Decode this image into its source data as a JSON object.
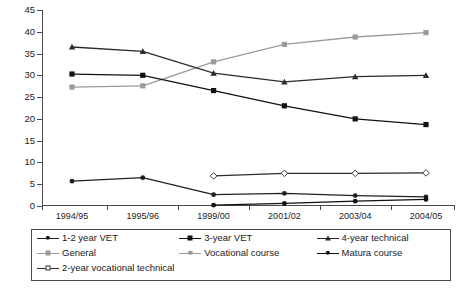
{
  "chart_data": {
    "type": "line",
    "title": "",
    "xlabel": "",
    "ylabel": "",
    "categories": [
      "1994/95",
      "1995/96",
      "1999/00",
      "2001/02",
      "2003/04",
      "2004/05"
    ],
    "ylim": [
      0,
      45
    ],
    "ytick_step": 5,
    "yticks": [
      0,
      5,
      10,
      15,
      20,
      25,
      30,
      35,
      40,
      45
    ],
    "grid": false,
    "legend_position": "bottom",
    "series": [
      {
        "name": "1-2 year VET",
        "marker": "dot",
        "color": "#1f1f1f",
        "values": [
          5.7,
          6.5,
          2.6,
          2.9,
          2.4,
          2.1
        ]
      },
      {
        "name": "3-year VET",
        "marker": "square",
        "color": "#111111",
        "values": [
          30.3,
          30.0,
          26.5,
          23.0,
          20.0,
          18.7
        ]
      },
      {
        "name": "4-year technical",
        "marker": "triangle",
        "color": "#2b2b2b",
        "values": [
          36.5,
          35.5,
          30.5,
          28.5,
          29.7,
          30.0
        ]
      },
      {
        "name": "General",
        "marker": "square",
        "color": "#9a9a9a",
        "values": [
          27.3,
          27.6,
          null,
          null,
          null,
          null
        ]
      },
      {
        "name": "Vocational course",
        "marker": "square",
        "color": "#9a9a9a",
        "values": [
          null,
          null,
          33.1,
          37.1,
          38.8,
          39.8
        ]
      },
      {
        "name": "Matura course",
        "marker": "dot",
        "color": "#111111",
        "values": [
          null,
          null,
          0.2,
          0.6,
          1.1,
          1.5
        ]
      },
      {
        "name": "2-year vocational technical",
        "marker": "diamond-open",
        "color": "#2b2b2b",
        "values": [
          null,
          null,
          6.9,
          7.5,
          7.5,
          7.6
        ]
      }
    ],
    "legend": [
      {
        "label": "1-2 year VET",
        "marker": "dot",
        "color": "#1f1f1f"
      },
      {
        "label": "3-year VET",
        "marker": "square",
        "color": "#111111"
      },
      {
        "label": "4-year technical",
        "marker": "triangle",
        "color": "#2b2b2b"
      },
      {
        "label": "General",
        "marker": "square",
        "color": "#9a9a9a"
      },
      {
        "label": "Vocational course",
        "marker": "dot",
        "color": "#9a9a9a"
      },
      {
        "label": "Matura course",
        "marker": "dot",
        "color": "#111111"
      },
      {
        "label": "2-year vocational technical",
        "marker": "diamond-open",
        "color": "#2b2b2b"
      }
    ]
  }
}
